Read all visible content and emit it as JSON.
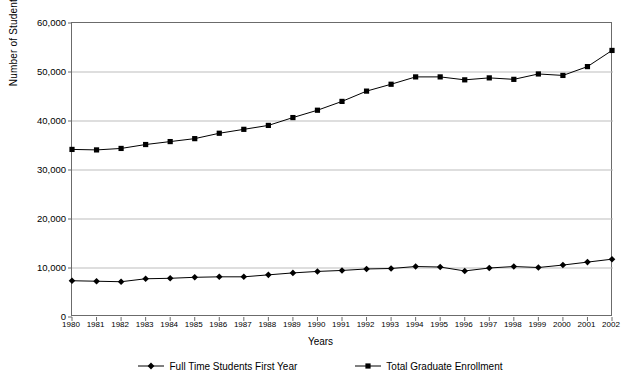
{
  "chart_data": {
    "type": "line",
    "title": "",
    "xlabel": "Years",
    "ylabel": "Number of Students",
    "grid": true,
    "legend_position": "bottom",
    "xlim": [
      1980,
      2002
    ],
    "ylim": [
      0,
      60000
    ],
    "ytick_values": [
      0,
      10000,
      20000,
      30000,
      40000,
      50000,
      60000
    ],
    "ytick_labels": [
      "0",
      "10,000",
      "20,000",
      "30,000",
      "40,000",
      "50,000",
      "60,000"
    ],
    "categories": [
      1980,
      1981,
      1982,
      1983,
      1984,
      1985,
      1986,
      1987,
      1988,
      1989,
      1990,
      1991,
      1992,
      1993,
      1994,
      1995,
      1996,
      1997,
      1998,
      1999,
      2000,
      2001,
      2002
    ],
    "xtick_labels": [
      "1980",
      "1981",
      "1982",
      "1983",
      "1984",
      "1985",
      "1986",
      "1987",
      "1988",
      "1989",
      "1990",
      "1991",
      "1992",
      "1993",
      "1994",
      "1995",
      "1996",
      "1997",
      "1998",
      "1999",
      "2000",
      "2001",
      "2002"
    ],
    "series": [
      {
        "name": "Full Time Students First Year",
        "marker": "diamond",
        "color": "#000000",
        "values": [
          7400,
          7300,
          7200,
          7800,
          7900,
          8100,
          8200,
          8200,
          8600,
          9000,
          9300,
          9500,
          9800,
          9900,
          10300,
          10200,
          9400,
          10000,
          10300,
          10100,
          10600,
          11200,
          11800
        ]
      },
      {
        "name": "Total Graduate Enrollment",
        "marker": "square",
        "color": "#000000",
        "values": [
          34200,
          34100,
          34400,
          35200,
          35800,
          36400,
          37500,
          38300,
          39100,
          40700,
          42200,
          44000,
          46100,
          47500,
          49000,
          49000,
          48400,
          48800,
          48500,
          49600,
          49300,
          51100,
          54400
        ]
      }
    ]
  },
  "legend": {
    "items": [
      {
        "label": "Full Time Students First Year"
      },
      {
        "label": "Total Graduate Enrollment"
      }
    ]
  }
}
